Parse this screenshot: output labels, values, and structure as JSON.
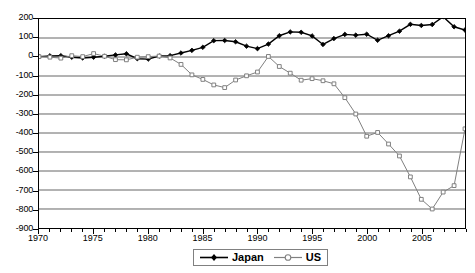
{
  "chart_data": {
    "type": "line",
    "title": "",
    "xlabel": "",
    "ylabel": "",
    "xlim": [
      1970,
      2009
    ],
    "ylim": [
      -900,
      200
    ],
    "ytick_step": 100,
    "grid": true,
    "legend_position": "bottom-center",
    "yticks": [
      200,
      100,
      0,
      -100,
      -200,
      -300,
      -400,
      -500,
      -600,
      -700,
      -800,
      -900
    ],
    "xticks_major": [
      1970,
      1975,
      1980,
      1985,
      1990,
      1995,
      2000,
      2005
    ],
    "xticks_minor_every": 1,
    "x": [
      1970,
      1971,
      1972,
      1973,
      1974,
      1975,
      1976,
      1977,
      1978,
      1979,
      1980,
      1981,
      1982,
      1983,
      1984,
      1985,
      1986,
      1987,
      1988,
      1989,
      1990,
      1991,
      1992,
      1993,
      1994,
      1995,
      1996,
      1997,
      1998,
      1999,
      2000,
      2001,
      2002,
      2003,
      2004,
      2005,
      2006,
      2007,
      2008,
      2009
    ],
    "series": [
      {
        "name": "Japan",
        "marker": "filled-diamond",
        "color": "#000000",
        "values": [
          2,
          6,
          7,
          -1,
          -5,
          -1,
          4,
          11,
          17,
          -9,
          -11,
          5,
          7,
          21,
          35,
          51,
          86,
          87,
          80,
          57,
          44,
          68,
          112,
          132,
          130,
          111,
          66,
          97,
          119,
          115,
          120,
          88,
          112,
          136,
          172,
          166,
          171,
          212,
          159,
          142
        ]
      },
      {
        "name": "US",
        "marker": "open-square",
        "color": "#808080",
        "values": [
          2,
          -1,
          -6,
          7,
          2,
          18,
          4,
          -14,
          -15,
          -1,
          2,
          5,
          -5,
          -39,
          -94,
          -118,
          -147,
          -161,
          -121,
          -99,
          -79,
          3,
          -50,
          -85,
          -122,
          -114,
          -125,
          -141,
          -214,
          -300,
          -417,
          -397,
          -458,
          -521,
          -631,
          -749,
          -800,
          -711,
          -677,
          -378
        ]
      }
    ]
  },
  "axes": {
    "y_labels": [
      "200",
      "100",
      "0",
      "-100",
      "-200",
      "-300",
      "-400",
      "-500",
      "-600",
      "-700",
      "-800",
      "-900"
    ],
    "x_labels": [
      "1970",
      "1975",
      "1980",
      "1985",
      "1990",
      "1995",
      "2000",
      "2005"
    ]
  },
  "legend": {
    "items": [
      {
        "label": "Japan",
        "marker": "filled-diamond-marker",
        "icon": "legend-line-japan-icon"
      },
      {
        "label": "US",
        "marker": "open-circle-marker",
        "icon": "legend-line-us-icon"
      }
    ]
  },
  "colors": {
    "japan": "#000000",
    "us": "#808080",
    "grid": "#666666",
    "frame": "#000000",
    "legend_border": "#808080"
  }
}
